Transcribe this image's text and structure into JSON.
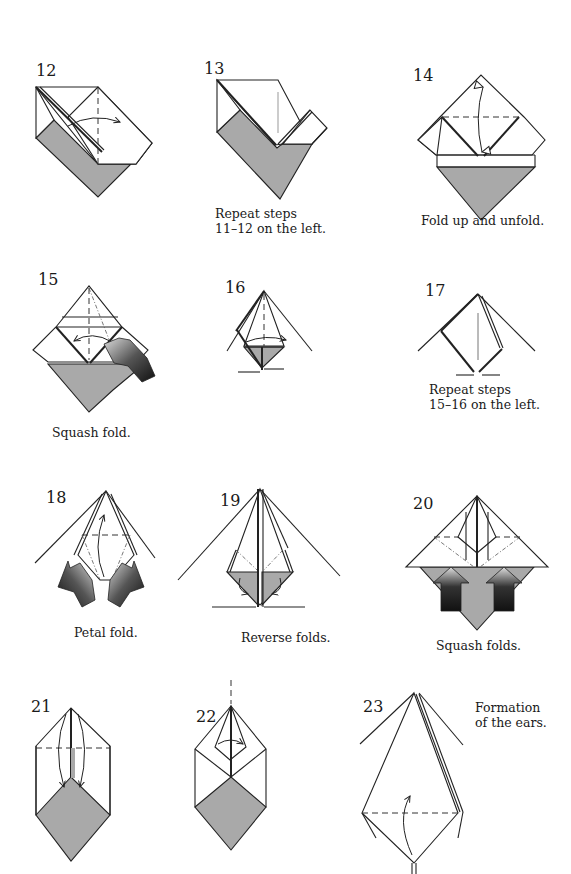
{
  "colors": {
    "paper_white": "#ffffff",
    "paper_colored": "#a9a9a9",
    "lines": "#222222",
    "push_arrow_dark": "#1a1a1a"
  },
  "steps": [
    {
      "number": "12",
      "caption": ""
    },
    {
      "number": "13",
      "caption": "Repeat steps\n11–12 on the left."
    },
    {
      "number": "14",
      "caption": "Fold up and unfold."
    },
    {
      "number": "15",
      "caption": "Squash fold."
    },
    {
      "number": "16",
      "caption": ""
    },
    {
      "number": "17",
      "caption": "Repeat steps\n15–16 on the left."
    },
    {
      "number": "18",
      "caption": "Petal fold."
    },
    {
      "number": "19",
      "caption": "Reverse folds."
    },
    {
      "number": "20",
      "caption": "Squash folds."
    },
    {
      "number": "21",
      "caption": ""
    },
    {
      "number": "22",
      "caption": ""
    },
    {
      "number": "23",
      "caption": "Formation\nof the ears."
    }
  ]
}
